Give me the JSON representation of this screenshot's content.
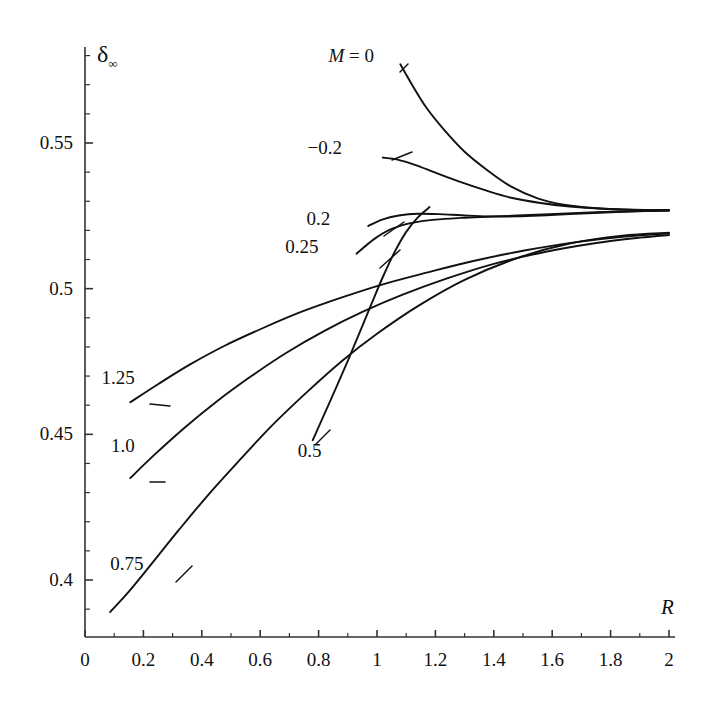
{
  "chart_data": {
    "type": "line",
    "title": "",
    "xlabel": "R",
    "ylabel": "δ∞",
    "xlim": [
      0,
      2
    ],
    "ylim": [
      0.378,
      0.582
    ],
    "grid": false,
    "legend": "inline-curve-labels",
    "x_ticks": [
      "0",
      "0.2",
      "0.4",
      "0.6",
      "0.8",
      "1",
      "1.2",
      "1.4",
      "1.6",
      "1.8",
      "2"
    ],
    "x_tick_values": [
      0,
      0.2,
      0.4,
      0.6,
      0.8,
      1.0,
      1.2,
      1.4,
      1.6,
      1.8,
      2.0
    ],
    "x_minor_step": 0.1,
    "y_ticks": [
      "0.4",
      "0.45",
      "0.5",
      "0.55"
    ],
    "y_tick_values": [
      0.4,
      0.45,
      0.5,
      0.55
    ],
    "y_minor_step": 0.01,
    "series": [
      {
        "name": "M = 0",
        "label": "M = 0",
        "label_prefix": "M",
        "label_value": "0",
        "x": [
          1.08,
          1.12,
          1.17,
          1.23,
          1.3,
          1.38,
          1.46,
          1.55,
          1.64,
          1.74,
          1.84,
          1.92,
          2.0
        ],
        "y": [
          0.577,
          0.57,
          0.562,
          0.5545,
          0.547,
          0.5405,
          0.535,
          0.531,
          0.5288,
          0.5277,
          0.5272,
          0.527,
          0.527
        ]
      },
      {
        "name": "M = -0.2",
        "label": "−0.2",
        "x": [
          1.02,
          1.07,
          1.13,
          1.2,
          1.28,
          1.37,
          1.46,
          1.56,
          1.66,
          1.76,
          1.86,
          1.94,
          2.0
        ],
        "y": [
          0.545,
          0.5443,
          0.5425,
          0.5398,
          0.5368,
          0.5338,
          0.5312,
          0.5294,
          0.5282,
          0.5275,
          0.5271,
          0.527,
          0.5269
        ]
      },
      {
        "name": "M = 0.2",
        "label": "0.2",
        "x": [
          0.97,
          1.02,
          1.08,
          1.14,
          1.21,
          1.29,
          1.38,
          1.48,
          1.58,
          1.7,
          1.82,
          1.92,
          2.0
        ],
        "y": [
          0.5215,
          0.5238,
          0.5252,
          0.5257,
          0.5256,
          0.5252,
          0.5248,
          0.5248,
          0.5252,
          0.5258,
          0.5263,
          0.5266,
          0.5268
        ]
      },
      {
        "name": "M = 0.25",
        "label": "0.25",
        "x": [
          0.93,
          0.99,
          1.05,
          1.12,
          1.2,
          1.29,
          1.38,
          1.48,
          1.59,
          1.71,
          1.83,
          1.93,
          2.0
        ],
        "y": [
          0.512,
          0.517,
          0.5205,
          0.5226,
          0.5237,
          0.5243,
          0.5247,
          0.5251,
          0.5256,
          0.5261,
          0.5265,
          0.5267,
          0.5268
        ]
      },
      {
        "name": "M = 0.5",
        "label": "0.5",
        "x": [
          0.78,
          0.82,
          0.86,
          0.9,
          0.94,
          0.98,
          1.02,
          1.06,
          1.1,
          1.14,
          1.18
        ],
        "y": [
          0.448,
          0.457,
          0.466,
          0.4752,
          0.4848,
          0.4945,
          0.504,
          0.5125,
          0.5195,
          0.5245,
          0.528
        ]
      },
      {
        "name": "M = 0.75",
        "label": "0.75",
        "x": [
          0.086,
          0.15,
          0.23,
          0.32,
          0.42,
          0.53,
          0.64,
          0.76,
          0.88,
          1.0,
          1.14,
          1.3,
          1.48,
          1.66,
          1.84,
          2.0
        ],
        "y": [
          0.389,
          0.396,
          0.4058,
          0.417,
          0.429,
          0.4412,
          0.453,
          0.4645,
          0.4752,
          0.4845,
          0.494,
          0.503,
          0.5105,
          0.5155,
          0.5182,
          0.5192
        ]
      },
      {
        "name": "M = 1.0",
        "label": "1.0",
        "x": [
          0.155,
          0.24,
          0.34,
          0.45,
          0.57,
          0.69,
          0.82,
          0.95,
          1.09,
          1.24,
          1.4,
          1.57,
          1.74,
          1.9,
          2.0
        ],
        "y": [
          0.435,
          0.4432,
          0.4522,
          0.4612,
          0.47,
          0.478,
          0.4855,
          0.492,
          0.498,
          0.5035,
          0.5085,
          0.5125,
          0.5155,
          0.5175,
          0.5184
        ]
      },
      {
        "name": "M = 1.25",
        "label": "1.25",
        "x": [
          0.155,
          0.25,
          0.36,
          0.48,
          0.61,
          0.74,
          0.88,
          1.02,
          1.17,
          1.33,
          1.5,
          1.67,
          1.84,
          2.0
        ],
        "y": [
          0.461,
          0.4672,
          0.474,
          0.4805,
          0.4865,
          0.492,
          0.497,
          0.5015,
          0.5055,
          0.5095,
          0.513,
          0.5158,
          0.5178,
          0.519
        ]
      }
    ],
    "annotations": [
      {
        "text": "M = 0",
        "x": 0.99,
        "y": 0.5795
      },
      {
        "text": "−0.2",
        "x": 0.88,
        "y": 0.548
      },
      {
        "text": "0.2",
        "x": 0.84,
        "y": 0.5235
      },
      {
        "text": "0.25",
        "x": 0.8,
        "y": 0.514
      },
      {
        "text": "0.5",
        "x": 0.81,
        "y": 0.444
      },
      {
        "text": "0.75",
        "x": 0.2,
        "y": 0.405
      },
      {
        "text": "1.0",
        "x": 0.17,
        "y": 0.4455
      },
      {
        "text": "1.25",
        "x": 0.17,
        "y": 0.469
      }
    ]
  },
  "axes": {
    "y_symbol": "δ",
    "y_subscript": "∞",
    "x_symbol": "R"
  },
  "colors": {
    "curve": "#111111",
    "axis": "#333333",
    "background": "#ffffff"
  }
}
